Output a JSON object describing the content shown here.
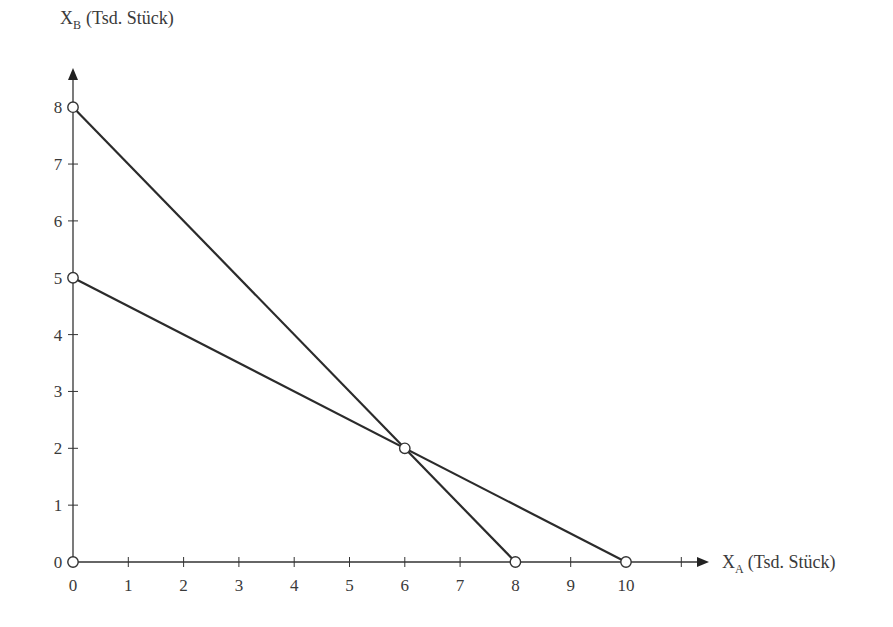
{
  "chart_data": {
    "type": "line",
    "title": "",
    "xlabel": "X_A (Tsd. Stück)",
    "ylabel": "X_B (Tsd. Stück)",
    "xlabel_main": "X",
    "xlabel_sub": "A",
    "xlabel_rest": "(Tsd. Stück)",
    "ylabel_main": "X",
    "ylabel_sub": "B",
    "ylabel_rest": "(Tsd. Stück)",
    "xlim": [
      0,
      11
    ],
    "ylim": [
      0,
      8
    ],
    "x_ticks": [
      "0",
      "1",
      "2",
      "3",
      "4",
      "5",
      "6",
      "7",
      "8",
      "9",
      "10"
    ],
    "y_ticks": [
      "0",
      "1",
      "2",
      "3",
      "4",
      "5",
      "6",
      "7",
      "8"
    ],
    "grid": false,
    "legend": null,
    "series": [
      {
        "name": "Line 1",
        "points": [
          [
            0,
            8
          ],
          [
            8,
            0
          ]
        ]
      },
      {
        "name": "Line 2",
        "points": [
          [
            0,
            5
          ],
          [
            10,
            0
          ]
        ]
      }
    ],
    "marked_points": [
      [
        0,
        0
      ],
      [
        0,
        5
      ],
      [
        0,
        8
      ],
      [
        8,
        0
      ],
      [
        10,
        0
      ],
      [
        6,
        2
      ]
    ],
    "intersection": [
      6,
      2
    ],
    "line_color": "#2b2b2b",
    "axis_color": "#333333"
  }
}
